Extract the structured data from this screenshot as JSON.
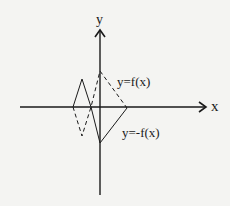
{
  "diagram": {
    "type": "function-graph-sketch",
    "axes": {
      "x_label": "x",
      "y_label": "y",
      "origin": [
        100,
        107
      ],
      "x_axis": {
        "from": [
          20,
          107
        ],
        "to": [
          206,
          107
        ]
      },
      "y_axis": {
        "from": [
          100,
          195
        ],
        "to": [
          100,
          30
        ]
      }
    },
    "curves": [
      {
        "name": "f",
        "label": "y=f(x)",
        "style": "dashed",
        "points": [
          [
            73,
            107
          ],
          [
            82,
            136
          ],
          [
            91,
            107
          ],
          [
            100,
            71
          ],
          [
            127,
            108
          ]
        ]
      },
      {
        "name": "neg-f",
        "label": "y=-f(x)",
        "style": "solid",
        "points": [
          [
            73,
            107
          ],
          [
            82,
            79
          ],
          [
            91,
            107
          ],
          [
            100,
            143
          ],
          [
            127,
            108
          ]
        ]
      }
    ],
    "colors": {
      "ink": "#1a1a1a",
      "background": "#f4f4f2"
    }
  }
}
